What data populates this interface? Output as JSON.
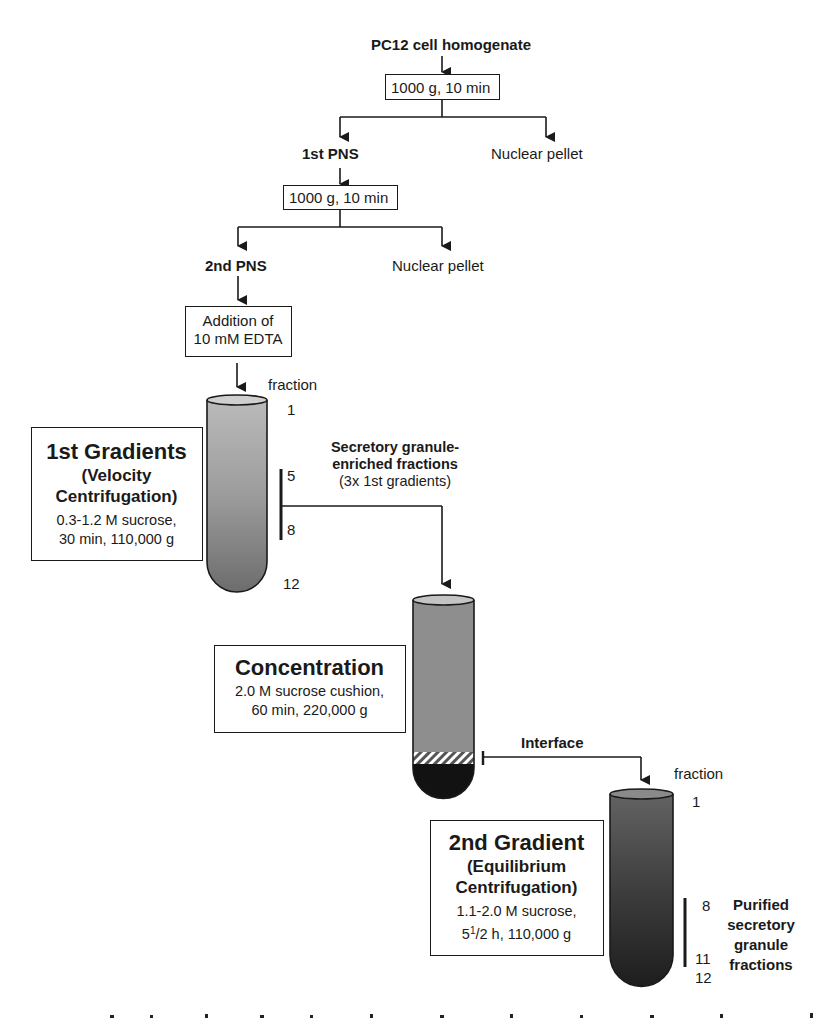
{
  "figure": {
    "start": "PC12 cell homogenate",
    "step1": {
      "spin": "1000 g, 10 min",
      "left": "1st PNS",
      "right": "Nuclear pellet"
    },
    "step2": {
      "spin": "1000 g, 10 min",
      "left": "2nd PNS",
      "right": "Nuclear pellet"
    },
    "addition": {
      "line1": "Addition of",
      "line2": "10 mM EDTA"
    },
    "gradient1": {
      "title": "1st Gradients",
      "subtitle1": "(Velocity",
      "subtitle2": "Centrifugation)",
      "cond1": "0.3-1.2 M sucrose,",
      "cond2": "30 min, 110,000 g",
      "fraction_label": "fraction",
      "fraction_top": "1",
      "fraction_from": "5",
      "fraction_to": "8",
      "fraction_bottom": "12"
    },
    "transfer1": {
      "line1": "Secretory granule-",
      "line2": "enriched fractions",
      "line3": "(3x 1st gradients)"
    },
    "concentration": {
      "title": "Concentration",
      "cond1": "2.0 M sucrose cushion,",
      "cond2": "60 min, 220,000 g"
    },
    "transfer2": {
      "label": "Interface"
    },
    "gradient2": {
      "title": "2nd Gradient",
      "subtitle1": "(Equilibrium",
      "subtitle2": "Centrifugation)",
      "cond1": "1.1-2.0 M sucrose,",
      "cond2_pre": "5",
      "cond2_sup": "1",
      "cond2_frac": "/2 h, 110,000 g",
      "fraction_label": "fraction",
      "fraction_top": "1",
      "fraction_from": "8",
      "fraction_to": "11",
      "fraction_bottom": "12",
      "result1": "Purified",
      "result2": "secretory",
      "result3": "granule",
      "result4": "fractions"
    }
  },
  "colors": {
    "ink": "#1a1a1a",
    "tube1_top": "#b4b4b4",
    "tube1_bottom": "#6e6e6e",
    "tube_conc": "#8e8e8e",
    "tube_conc_pellet": "#121212",
    "tube2_top": "#5a5a5a",
    "tube2_bottom": "#1e1e1e"
  }
}
